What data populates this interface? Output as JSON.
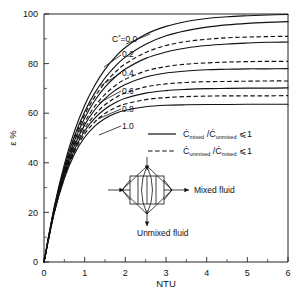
{
  "chart_data": {
    "type": "line",
    "title": "",
    "xlabel": "NTU",
    "ylabel": "ε %",
    "xlim": [
      0,
      6
    ],
    "ylim": [
      0,
      100
    ],
    "xticks": [
      0,
      1,
      2,
      3,
      4,
      5,
      6
    ],
    "xtick_labels": [
      "0",
      "1",
      "2",
      "3",
      "4",
      "5",
      "6"
    ],
    "xminor_step": 0.5,
    "yticks": [
      0,
      20,
      40,
      60,
      80,
      100
    ],
    "ytick_labels": [
      "0",
      "20",
      "40",
      "60",
      "80",
      "100"
    ],
    "yminor_step": 10,
    "grid": false,
    "legend_position": "center-right",
    "series": [
      {
        "name": "C*=0.0",
        "label": "C*=0.0",
        "cstar": 0.0,
        "style": "solid",
        "x": [
          0,
          0.25,
          0.5,
          0.75,
          1,
          1.25,
          1.5,
          1.75,
          2,
          2.5,
          3,
          3.5,
          4,
          4.5,
          5,
          5.5,
          6
        ],
        "y": [
          0,
          22.1,
          39.3,
          52.8,
          63.2,
          71.3,
          77.7,
          82.6,
          86.5,
          91.8,
          95.0,
          97.0,
          98.2,
          98.9,
          99.3,
          99.6,
          99.8
        ]
      },
      {
        "name": "C*=0.2 mixed/unmixed",
        "label": "0.2",
        "cstar": 0.2,
        "style": "solid",
        "x": [
          0,
          0.25,
          0.5,
          0.75,
          1,
          1.25,
          1.5,
          1.75,
          2,
          2.5,
          3,
          3.5,
          4,
          4.5,
          5,
          5.5,
          6
        ],
        "y": [
          0,
          21.5,
          38.0,
          50.8,
          60.6,
          68.2,
          74.2,
          78.9,
          82.6,
          87.8,
          91.2,
          93.3,
          94.7,
          95.6,
          96.2,
          96.6,
          96.9
        ]
      },
      {
        "name": "C*=0.2 unmixed/mixed",
        "label": "0.2",
        "cstar": 0.2,
        "style": "dashed",
        "x": [
          0,
          0.25,
          0.5,
          0.75,
          1,
          1.25,
          1.5,
          1.75,
          2,
          2.5,
          3,
          3.5,
          4,
          4.5,
          5,
          5.5,
          6
        ],
        "y": [
          0,
          21.4,
          37.6,
          50.0,
          59.4,
          66.6,
          72.2,
          76.5,
          79.9,
          84.5,
          87.3,
          88.9,
          89.8,
          90.4,
          90.7,
          90.9,
          91.0
        ]
      },
      {
        "name": "C*=0.4 mixed/unmixed",
        "label": "0.4",
        "cstar": 0.4,
        "style": "solid",
        "x": [
          0,
          0.25,
          0.5,
          0.75,
          1,
          1.25,
          1.5,
          1.75,
          2,
          2.5,
          3,
          3.5,
          4,
          4.5,
          5,
          5.5,
          6
        ],
        "y": [
          0,
          21.0,
          36.8,
          48.9,
          58.1,
          65.1,
          70.5,
          74.6,
          77.8,
          82.1,
          84.7,
          86.3,
          87.3,
          87.9,
          88.3,
          88.6,
          88.7
        ]
      },
      {
        "name": "C*=0.4 unmixed/mixed",
        "label": "0.4",
        "cstar": 0.4,
        "style": "dashed",
        "x": [
          0,
          0.25,
          0.5,
          0.75,
          1,
          1.25,
          1.5,
          1.75,
          2,
          2.5,
          3,
          3.5,
          4,
          4.5,
          5,
          5.5,
          6
        ],
        "y": [
          0,
          20.8,
          36.2,
          47.8,
          56.4,
          62.8,
          67.6,
          71.1,
          73.7,
          77.0,
          78.8,
          79.8,
          80.3,
          80.6,
          80.8,
          80.9,
          80.9
        ]
      },
      {
        "name": "C*=0.6 mixed/unmixed",
        "label": "0.6",
        "cstar": 0.6,
        "style": "solid",
        "x": [
          0,
          0.25,
          0.5,
          0.75,
          1,
          1.25,
          1.5,
          1.75,
          2,
          2.5,
          3,
          3.5,
          4,
          4.5,
          5,
          5.5,
          6
        ],
        "y": [
          0,
          20.6,
          35.7,
          47.0,
          55.3,
          61.4,
          65.9,
          69.2,
          71.6,
          74.6,
          76.2,
          77.0,
          77.5,
          77.7,
          77.9,
          77.9,
          78.0
        ]
      },
      {
        "name": "C*=0.6 unmixed/mixed",
        "label": "0.6",
        "cstar": 0.6,
        "style": "dashed",
        "x": [
          0,
          0.25,
          0.5,
          0.75,
          1,
          1.25,
          1.5,
          1.75,
          2,
          2.5,
          3,
          3.5,
          4,
          4.5,
          5,
          5.5,
          6
        ],
        "y": [
          0,
          20.3,
          35.1,
          46.0,
          53.8,
          59.4,
          63.4,
          66.2,
          68.2,
          70.6,
          71.8,
          72.4,
          72.7,
          72.8,
          72.9,
          73.0,
          73.0
        ]
      },
      {
        "name": "C*=0.8 mixed/unmixed",
        "label": "0.8",
        "cstar": 0.8,
        "style": "solid",
        "x": [
          0,
          0.25,
          0.5,
          0.75,
          1,
          1.25,
          1.5,
          1.75,
          2,
          2.5,
          3,
          3.5,
          4,
          4.5,
          5,
          5.5,
          6
        ],
        "y": [
          0,
          20.1,
          34.7,
          45.3,
          52.8,
          58.0,
          61.7,
          64.2,
          66.0,
          68.1,
          69.1,
          69.6,
          69.9,
          70.0,
          70.1,
          70.1,
          70.2
        ]
      },
      {
        "name": "C*=0.8 unmixed/mixed",
        "label": "0.8",
        "cstar": 0.8,
        "style": "dashed",
        "x": [
          0,
          0.25,
          0.5,
          0.75,
          1,
          1.25,
          1.5,
          1.75,
          2,
          2.5,
          3,
          3.5,
          4,
          4.5,
          5,
          5.5,
          6
        ],
        "y": [
          0,
          19.9,
          34.2,
          44.5,
          51.6,
          56.5,
          59.9,
          62.2,
          63.7,
          65.5,
          66.3,
          66.7,
          66.9,
          67.0,
          67.0,
          67.0,
          67.1
        ]
      },
      {
        "name": "C*=1.0",
        "label": "1.0",
        "cstar": 1.0,
        "style": "solid",
        "x": [
          0,
          0.25,
          0.5,
          0.75,
          1,
          1.25,
          1.5,
          1.75,
          2,
          2.5,
          3,
          3.5,
          4,
          4.5,
          5,
          5.5,
          6
        ],
        "y": [
          0,
          19.6,
          33.6,
          43.5,
          50.3,
          54.8,
          57.9,
          59.9,
          61.2,
          62.6,
          63.2,
          63.4,
          63.5,
          63.5,
          63.6,
          63.6,
          63.6
        ]
      }
    ],
    "curve_labels": [
      {
        "text": "C*=0.0",
        "has_star": true,
        "base": "C",
        "star": "*",
        "tail": "=0.0"
      },
      {
        "text": "0.2"
      },
      {
        "text": "0.4"
      },
      {
        "text": "0.6"
      },
      {
        "text": "0.8"
      },
      {
        "text": "1.0"
      }
    ],
    "legend": [
      {
        "style": "solid",
        "num_base": "C",
        "num_dot": "̇",
        "num_sub": "mixed",
        "den_base": "C",
        "den_dot": "̇",
        "den_sub": "unmixed",
        "relation": "⩽1"
      },
      {
        "style": "dashed",
        "num_base": "C",
        "num_dot": "̇",
        "num_sub": "unmixed",
        "den_base": "C",
        "den_dot": "̇",
        "den_sub": "mixed",
        "relation": "⩽1"
      }
    ],
    "inset": {
      "name": "crossflow-heat-exchanger-symbol",
      "mixed_label": "Mixed  fluid",
      "unmixed_label": "Unmixed  fluid"
    },
    "colors": {
      "line": "#111111",
      "axis": "#222222",
      "background": "#ffffff"
    }
  }
}
